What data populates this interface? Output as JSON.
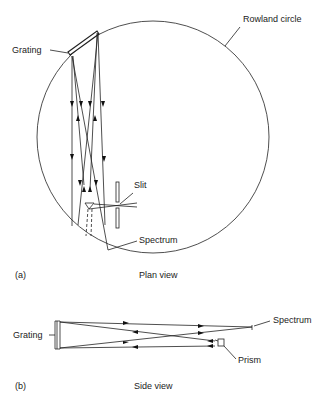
{
  "figure": {
    "panel_a": {
      "letter": "(a)",
      "caption": "Plan view",
      "labels": {
        "grating": "Grating",
        "rowland_circle": "Rowland circle",
        "slit": "Slit",
        "spectrum": "Spectrum"
      }
    },
    "panel_b": {
      "letter": "(b)",
      "caption": "Side view",
      "labels": {
        "grating": "Grating",
        "spectrum": "Spectrum",
        "prism": "Prism"
      }
    }
  }
}
